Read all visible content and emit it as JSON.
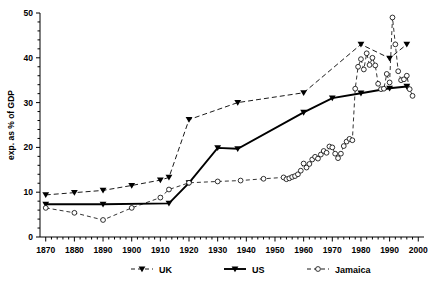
{
  "chart_data": {
    "type": "line",
    "title": "",
    "xlabel": "",
    "ylabel": "exp. as % of GDP",
    "xlim": [
      1868,
      2002
    ],
    "ylim": [
      0,
      50
    ],
    "grid": false,
    "legend_position": "bottom",
    "xticks": [
      1870,
      1880,
      1890,
      1900,
      1910,
      1920,
      1930,
      1940,
      1950,
      1960,
      1970,
      1980,
      1990,
      2000
    ],
    "xtick_labels": [
      "1870",
      "1880",
      "1890",
      "1900",
      "1910",
      "1920",
      "1930",
      "1940",
      "1950",
      "1960",
      "1970",
      "1980",
      "1990",
      "2000"
    ],
    "yticks": [
      0,
      10,
      20,
      30,
      40,
      50
    ],
    "ytick_labels": [
      "0",
      "10",
      "20",
      "30",
      "40",
      "50"
    ],
    "minor_ticks": true,
    "series": [
      {
        "name": "UK",
        "marker": "triangle-down-filled",
        "linestyle": "dashed",
        "color": "#000000",
        "points": [
          [
            1870,
            9.4
          ],
          [
            1880,
            9.9
          ],
          [
            1890,
            10.4
          ],
          [
            1900,
            11.5
          ],
          [
            1910,
            12.7
          ],
          [
            1913,
            13.3
          ],
          [
            1920,
            26.2
          ],
          [
            1937,
            30.0
          ],
          [
            1960,
            32.2
          ],
          [
            1980,
            43.0
          ],
          [
            1990,
            39.9
          ],
          [
            1996,
            43.0
          ]
        ]
      },
      {
        "name": "US",
        "marker": "triangle-down-filled",
        "linestyle": "solid",
        "color": "#000000",
        "points": [
          [
            1870,
            7.3
          ],
          [
            1890,
            7.3
          ],
          [
            1913,
            7.5
          ],
          [
            1920,
            12.1
          ],
          [
            1930,
            19.9
          ],
          [
            1937,
            19.7
          ],
          [
            1960,
            27.8
          ],
          [
            1970,
            31.0
          ],
          [
            1980,
            32.1
          ],
          [
            1990,
            33.2
          ],
          [
            1996,
            33.6
          ]
        ]
      },
      {
        "name": "Jamaica",
        "marker": "circle-open",
        "linestyle": "dashed",
        "color": "#000000",
        "points": [
          [
            1870,
            6.5
          ],
          [
            1880,
            5.4
          ],
          [
            1890,
            3.8
          ],
          [
            1900,
            6.5
          ],
          [
            1910,
            8.8
          ],
          [
            1913,
            10.6
          ],
          [
            1920,
            12.1
          ],
          [
            1930,
            12.4
          ],
          [
            1938,
            12.6
          ],
          [
            1946,
            13.0
          ],
          [
            1953,
            13.3
          ],
          [
            1954,
            12.9
          ],
          [
            1955,
            13.1
          ],
          [
            1956,
            13.4
          ],
          [
            1957,
            13.6
          ],
          [
            1958,
            14.0
          ],
          [
            1959,
            14.8
          ],
          [
            1960,
            16.4
          ],
          [
            1961,
            15.5
          ],
          [
            1962,
            16.3
          ],
          [
            1963,
            17.3
          ],
          [
            1964,
            17.9
          ],
          [
            1965,
            17.5
          ],
          [
            1966,
            18.4
          ],
          [
            1967,
            19.2
          ],
          [
            1968,
            18.8
          ],
          [
            1969,
            20.2
          ],
          [
            1970,
            20.0
          ],
          [
            1971,
            18.6
          ],
          [
            1972,
            17.6
          ],
          [
            1973,
            18.6
          ],
          [
            1974,
            20.3
          ],
          [
            1975,
            21.3
          ],
          [
            1976,
            21.9
          ],
          [
            1977,
            21.6
          ],
          [
            1978,
            33.1
          ],
          [
            1979,
            38.0
          ],
          [
            1980,
            39.7
          ],
          [
            1981,
            37.4
          ],
          [
            1982,
            41.0
          ],
          [
            1983,
            38.4
          ],
          [
            1984,
            40.0
          ],
          [
            1985,
            38.3
          ],
          [
            1986,
            34.2
          ],
          [
            1987,
            33.0
          ],
          [
            1988,
            33.1
          ],
          [
            1989,
            36.4
          ],
          [
            1990,
            34.5
          ],
          [
            1991,
            49.0
          ],
          [
            1992,
            43.0
          ],
          [
            1993,
            37.0
          ],
          [
            1994,
            35.0
          ],
          [
            1995,
            35.2
          ],
          [
            1996,
            36.0
          ],
          [
            1997,
            33.0
          ],
          [
            1998,
            31.5
          ]
        ]
      }
    ]
  },
  "legend": {
    "items": [
      {
        "label": "UK",
        "marker": "triangle-down-filled",
        "style": "dashed"
      },
      {
        "label": "US",
        "marker": "triangle-down-filled",
        "style": "solid"
      },
      {
        "label": "Jamaica",
        "marker": "circle-open",
        "style": "dashed"
      }
    ]
  }
}
